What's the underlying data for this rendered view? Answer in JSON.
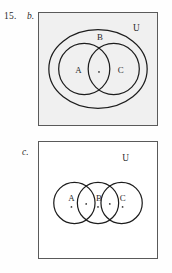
{
  "exercise": {
    "number": "15.",
    "parts": [
      {
        "key": "b",
        "label": "b."
      },
      {
        "key": "c",
        "label": "c."
      }
    ]
  },
  "diagram_b": {
    "universe_label": "U",
    "outer_set_label": "B",
    "left_set_label": "A",
    "right_set_label": "C",
    "element_dots": 1,
    "background_color": "#f0f0f0",
    "border_color": "#5a5a5a",
    "stroke_color": "#1d1d1d",
    "description": "Two overlapping circles A and C nested inside a larger ellipse B, all inside rectangle U"
  },
  "diagram_c": {
    "universe_label": "U",
    "set_labels": [
      "A",
      "B",
      "C"
    ],
    "element_dots": 5,
    "background_color": "#ffffff",
    "border_color": "#5a5a5a",
    "stroke_color": "#1d1d1d",
    "description": "Three circles A, B, C in a row, each adjacent pair overlapping, inside rectangle U"
  }
}
